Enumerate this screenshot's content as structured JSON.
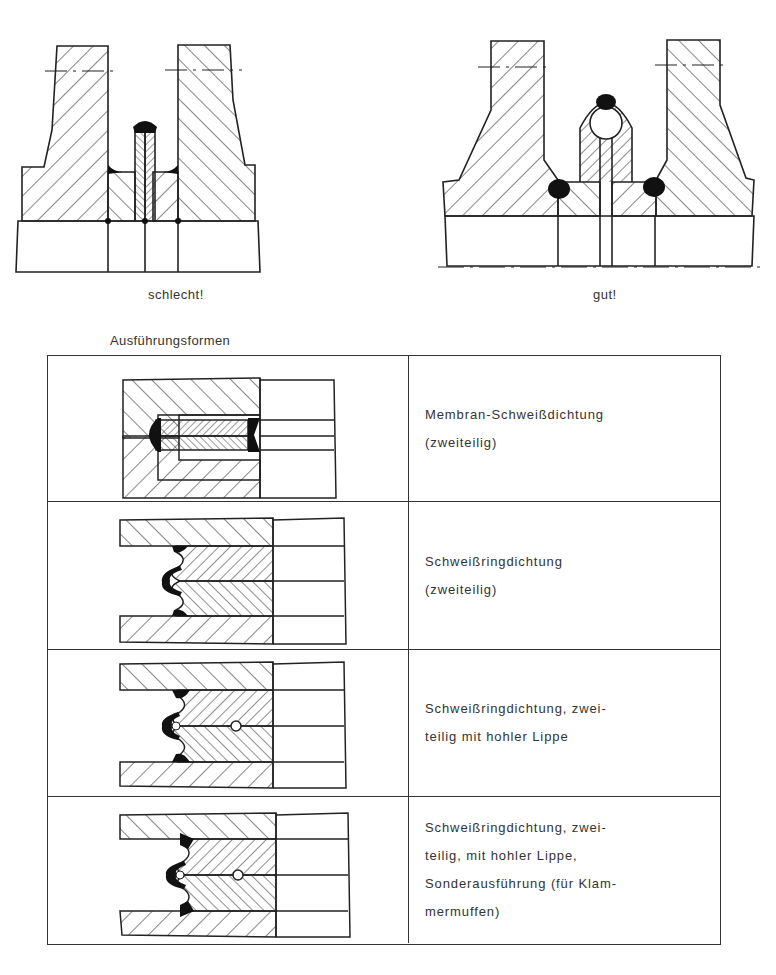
{
  "figures": {
    "bad": {
      "caption": "schlecht!"
    },
    "good": {
      "caption": "gut!"
    }
  },
  "variants": {
    "title": "Ausführungsformen",
    "rows": [
      {
        "lines": [
          "Membran-Schweißdichtung",
          "(zweiteilig)"
        ]
      },
      {
        "lines": [
          "Schweißringdichtung",
          "(zweiteilig)"
        ]
      },
      {
        "lines": [
          "Schweißringdichtung, zwei-",
          "teilig mit hohler Lippe"
        ]
      },
      {
        "lines": [
          "Schweißringdichtung, zwei-",
          "teilig, mit hohler Lippe,",
          "Sonderausführung (für Klam-",
          "mermuffen)"
        ]
      }
    ]
  },
  "colors": {
    "ink": "#222222",
    "paper": "#ffffff"
  }
}
